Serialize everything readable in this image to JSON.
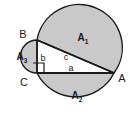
{
  "figure": {
    "kind": "geometry-diagram",
    "background_color": "#ffffff",
    "fill_color": "#c9c9c9",
    "stroke_color": "#1a1a1a",
    "vertices": [
      {
        "name": "B",
        "label": "B",
        "x": 37,
        "y": 40
      },
      {
        "name": "C",
        "label": "C",
        "x": 37,
        "y": 73
      },
      {
        "name": "A",
        "label": "A",
        "x": 114,
        "y": 73
      }
    ],
    "sides": [
      {
        "name": "a",
        "label": "a",
        "from": "C",
        "to": "A"
      },
      {
        "name": "b",
        "label": "b",
        "from": "B",
        "to": "C"
      },
      {
        "name": "c",
        "label": "c",
        "from": "B",
        "to": "A"
      }
    ],
    "areas": [
      {
        "name": "A1",
        "label": "A",
        "subscript": "1"
      },
      {
        "name": "A2",
        "label": "A",
        "subscript": "2"
      },
      {
        "name": "A3",
        "label": "A",
        "subscript": "3"
      }
    ],
    "right_angle": {
      "at": "C",
      "marker": "square"
    }
  }
}
